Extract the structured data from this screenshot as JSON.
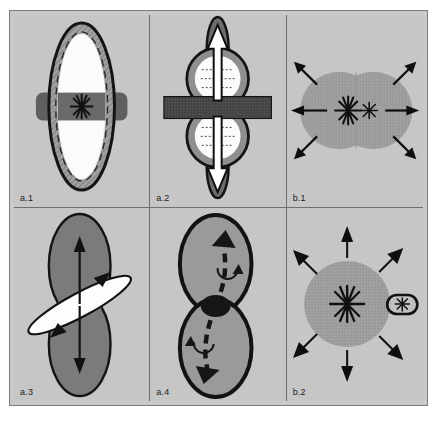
{
  "figure": {
    "layout": {
      "rows": 2,
      "columns": 3
    },
    "background_color": "#c6c6c6",
    "frame_color": "#7d7d7d",
    "panel_divider_color": "#6f6f6f"
  },
  "colors": {
    "panel_background": "#c6c6c6",
    "cell_body_gray": "#8d8d8d",
    "cell_body_dark": "#6e6e6e",
    "cell_inner_white": "#fbfbfb",
    "cell_mid_gray": "#a4a4a4",
    "band_dark": "#5a5a5a",
    "outline_black": "#151515",
    "hatch_gray": "#9a9a9a",
    "stipple_gray": "#9d9d9d"
  },
  "panels": [
    {
      "id": "a1",
      "label": "a.1",
      "row": 1,
      "column": 1,
      "description": "Elongated vertical ellipse cell with hatched cortex, white inner region and dark horizontal equatorial band crossing the midline; a single radial aster at the cell center.",
      "elements": {
        "cell_shape": "vertical-ellipse",
        "cortex": "hatched-ring",
        "inner_region": "white-ellipse",
        "band": "horizontal-dark-band",
        "aster_count": 1,
        "arrow_count": 0
      }
    },
    {
      "id": "a2",
      "label": "a.2",
      "row": 1,
      "column": 2,
      "description": "Dumbbell cell of two stacked lobes with white interiors and dotted internal fibers; a dark horizontal band at the constriction and two large white outward arrows pointing up and down through polar extensions.",
      "elements": {
        "cell_shape": "vertical-dumbbell-two-lobes",
        "inner_region": "white-circles-with-dotted-fibers",
        "band": "horizontal-dark-band",
        "aster_count": 0,
        "arrow_count": 2,
        "arrow_direction": "up-and-down"
      }
    },
    {
      "id": "b1",
      "label": "b.1",
      "row": 1,
      "column": 3,
      "description": "Two overlapping stippled circles forming a horizontal binucleate cell; one large aster and one small aster side by side at the center, with six black arrows radiating outward (two horizontal, four diagonal).",
      "elements": {
        "cell_shape": "two-overlapping-horizontal-circles",
        "fill": "stippled-gray",
        "aster_count": 2,
        "arrow_count": 6,
        "arrow_direction": "radial-outward"
      }
    },
    {
      "id": "a3",
      "label": "a.3",
      "row": 2,
      "column": 1,
      "description": "Vertical peanut-shaped cell in dark gray with a diagonal white lens-shaped spindle crossing the constriction; black arrows point up and down along the long axis and two arrowheads run along the tilted spindle.",
      "elements": {
        "cell_shape": "vertical-peanut",
        "spindle": "diagonal-white-lens",
        "aster_count": 0,
        "arrow_count": 4,
        "arrow_direction": "axial-and-diagonal"
      }
    },
    {
      "id": "a4",
      "label": "a.4",
      "row": 2,
      "column": 2,
      "description": "Vertical dumbbell cell outlined in heavy black with a dark ellipse at the constriction; a thick dashed S-shaped path with arrowheads runs from the lower lobe to the upper lobe and two small curved rotation arrows indicate torque.",
      "elements": {
        "cell_shape": "vertical-dumbbell-two-lobes",
        "midbody": "dark-ellipse",
        "path": "dashed-s-curve",
        "aster_count": 0,
        "arrow_count": 2,
        "rotation_arrow_count": 2
      }
    },
    {
      "id": "b2",
      "label": "b.2",
      "row": 2,
      "column": 3,
      "description": "Single stippled round cell with a central aster and a small capsule-shaped bud containing a small aster attached on the right; eight black arrows radiate outward around the cell.",
      "elements": {
        "cell_shape": "single-circle",
        "fill": "stippled-gray",
        "bud": "right-capsule-with-aster",
        "aster_count": 2,
        "arrow_count": 8,
        "arrow_direction": "radial-outward"
      }
    }
  ]
}
